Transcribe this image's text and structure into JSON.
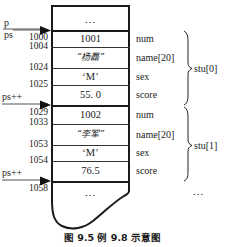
{
  "figure": {
    "caption": "图 9.5  例 9.8 示意图",
    "top_cell": "...",
    "bottom_cell": "...",
    "tail_ellipsis": "..."
  },
  "pointers": [
    {
      "name": "p-label",
      "text": "p"
    },
    {
      "name": "ps-label",
      "text": "ps"
    },
    {
      "name": "ps-inc-1",
      "text": "ps++"
    },
    {
      "name": "ps-inc-2",
      "text": "ps++"
    }
  ],
  "addresses": [
    "1000",
    "1004",
    "1024",
    "1025",
    "1029",
    "1033",
    "1053",
    "1054",
    "1058"
  ],
  "fields": [
    "num",
    "name[20]",
    "sex",
    "score",
    "num",
    "name[20]",
    "sex",
    "score"
  ],
  "cells": [
    "1001",
    "“杨磊”",
    "‘M’",
    "55. 0",
    "1002",
    "“李军”",
    "‘M’",
    "76.5"
  ],
  "groups": [
    "stu[0]",
    "stu[1]"
  ],
  "colors": {
    "stroke": "#1a1a1a",
    "rule": "#333333",
    "background": "#ffffff"
  }
}
